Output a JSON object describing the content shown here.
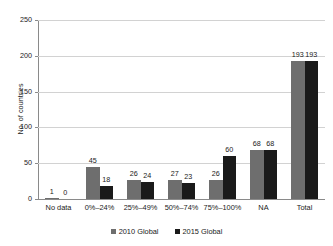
{
  "chart_data": {
    "type": "bar",
    "title": "",
    "xlabel": "",
    "ylabel": "No. of countries",
    "ylim": [
      0,
      250
    ],
    "yticks": [
      0,
      50,
      100,
      150,
      200,
      250
    ],
    "grid": true,
    "legend_position": "bottom",
    "categories": [
      "No data",
      "0%–24%",
      "25%–49%",
      "50%–74%",
      "75%–100%",
      "NA",
      "Total"
    ],
    "series": [
      {
        "name": "2010 Global",
        "color": "#6e6e6e",
        "values": [
          1,
          45,
          26,
          27,
          26,
          68,
          193
        ]
      },
      {
        "name": "2015 Global",
        "color": "#1a1a1a",
        "values": [
          0,
          18,
          24,
          23,
          60,
          68,
          193
        ]
      }
    ],
    "value_labels": {
      "2010 Global": [
        "1",
        "45",
        "26",
        "27",
        "26",
        "68",
        "193"
      ],
      "2015 Global": [
        "0",
        "18",
        "24",
        "23",
        "60",
        "68",
        "193"
      ]
    },
    "ytick_labels": [
      "0",
      "50",
      "100",
      "150",
      "200",
      "250"
    ]
  },
  "axes": {
    "y_title": "No. of countries"
  },
  "legend": {
    "items": [
      {
        "label": "2010 Global",
        "color": "#6e6e6e"
      },
      {
        "label": "2015 Global",
        "color": "#1a1a1a"
      }
    ]
  },
  "colors": {
    "series_2010": "#6e6e6e",
    "series_2015": "#1a1a1a",
    "gridline": "#d2d2d2",
    "axis": "#8a8a8a",
    "background": "#ffffff",
    "text": "#1a1a1a"
  }
}
